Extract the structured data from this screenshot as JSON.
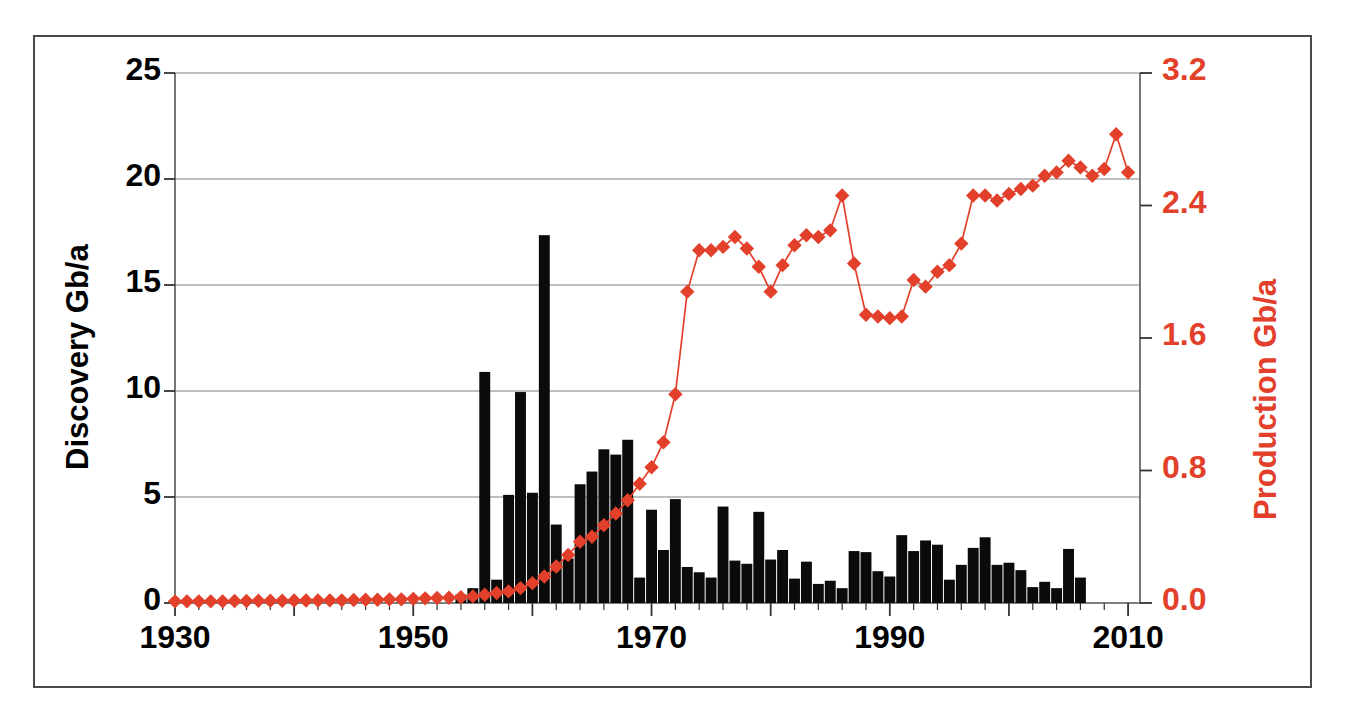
{
  "chart_data": {
    "type": "bar",
    "title": "",
    "subtitle": "",
    "xlabel": "",
    "ylabel": "Discovery Gb/a",
    "y2label": "Production Gb/a",
    "grid": true,
    "legend": "none",
    "xlim": [
      1930,
      2011
    ],
    "ylim": [
      0,
      25
    ],
    "y2lim": [
      0.0,
      3.2
    ],
    "x_ticks": [
      "1930",
      "1950",
      "1970",
      "1990",
      "2010"
    ],
    "x_tick_values": [
      1930,
      1950,
      1970,
      1990,
      2010
    ],
    "y_ticks": [
      "0",
      "5",
      "10",
      "15",
      "20",
      "25"
    ],
    "y_tick_values": [
      0,
      5,
      10,
      15,
      20,
      25
    ],
    "y2_ticks": [
      "0.0",
      "0.8",
      "1.6",
      "2.4",
      "3.2"
    ],
    "y2_tick_values": [
      0.0,
      0.8,
      1.6,
      2.4,
      3.2
    ],
    "colors": {
      "bars": "#0b0b0b",
      "line": "#E2402A",
      "marker": "#E2402A",
      "grid": "#808080",
      "axis": "#555555",
      "frame": "#4a4a4a",
      "left_axis_text": "#000000",
      "right_axis_text": "#E2402A"
    },
    "series": [
      {
        "name": "Discovery Gb/a",
        "type": "bar",
        "axis": "left",
        "x": [
          1930,
          1931,
          1932,
          1933,
          1934,
          1935,
          1936,
          1937,
          1938,
          1939,
          1940,
          1941,
          1942,
          1943,
          1944,
          1945,
          1946,
          1947,
          1948,
          1949,
          1950,
          1951,
          1952,
          1953,
          1954,
          1955,
          1956,
          1957,
          1958,
          1959,
          1960,
          1961,
          1962,
          1963,
          1964,
          1965,
          1966,
          1967,
          1968,
          1969,
          1970,
          1971,
          1972,
          1973,
          1974,
          1975,
          1976,
          1977,
          1978,
          1979,
          1980,
          1981,
          1982,
          1983,
          1984,
          1985,
          1986,
          1987,
          1988,
          1989,
          1990,
          1991,
          1992,
          1993,
          1994,
          1995,
          1996,
          1997,
          1998,
          1999,
          2000,
          2001,
          2002,
          2003,
          2004,
          2005,
          2006,
          2007,
          2008,
          2009,
          2010
        ],
        "values": [
          0,
          0,
          0,
          0,
          0,
          0,
          0,
          0,
          0,
          0,
          0,
          0,
          0,
          0,
          0,
          0,
          0,
          0,
          0,
          0,
          0,
          0,
          0,
          0,
          0.4,
          0.7,
          10.9,
          1.1,
          5.1,
          9.95,
          5.2,
          17.35,
          3.7,
          2.1,
          5.6,
          6.2,
          7.25,
          7.0,
          7.7,
          1.2,
          4.4,
          2.5,
          4.9,
          1.7,
          1.45,
          1.2,
          4.55,
          2.0,
          1.85,
          4.3,
          2.05,
          2.5,
          1.15,
          1.95,
          0.9,
          1.05,
          0.7,
          2.45,
          2.4,
          1.5,
          1.25,
          3.2,
          2.45,
          2.95,
          2.75,
          1.1,
          1.8,
          2.6,
          3.1,
          1.8,
          1.9,
          1.55,
          0.75,
          1.0,
          0.7,
          2.55,
          1.2,
          0,
          0,
          0,
          0
        ]
      },
      {
        "name": "Production Gb/a",
        "type": "line",
        "axis": "right",
        "marker": "diamond",
        "x": [
          1930,
          1931,
          1932,
          1933,
          1934,
          1935,
          1936,
          1937,
          1938,
          1939,
          1940,
          1941,
          1942,
          1943,
          1944,
          1945,
          1946,
          1947,
          1948,
          1949,
          1950,
          1951,
          1952,
          1953,
          1954,
          1955,
          1956,
          1957,
          1958,
          1959,
          1960,
          1961,
          1962,
          1963,
          1964,
          1965,
          1966,
          1967,
          1968,
          1969,
          1970,
          1971,
          1972,
          1973,
          1974,
          1975,
          1976,
          1977,
          1978,
          1979,
          1980,
          1981,
          1982,
          1983,
          1984,
          1985,
          1986,
          1987,
          1988,
          1989,
          1990,
          1991,
          1992,
          1993,
          1994,
          1995,
          1996,
          1997,
          1998,
          1999,
          2000,
          2001,
          2002,
          2003,
          2004,
          2005,
          2006,
          2007,
          2008,
          2009,
          2010
        ],
        "values": [
          0.01,
          0.01,
          0.01,
          0.01,
          0.01,
          0.012,
          0.012,
          0.014,
          0.014,
          0.014,
          0.015,
          0.015,
          0.015,
          0.016,
          0.016,
          0.018,
          0.02,
          0.02,
          0.022,
          0.022,
          0.025,
          0.028,
          0.03,
          0.032,
          0.035,
          0.04,
          0.05,
          0.06,
          0.07,
          0.09,
          0.12,
          0.16,
          0.22,
          0.29,
          0.37,
          0.4,
          0.47,
          0.54,
          0.62,
          0.72,
          0.82,
          0.97,
          1.26,
          1.88,
          2.13,
          2.13,
          2.15,
          2.21,
          2.14,
          2.03,
          1.88,
          2.04,
          2.16,
          2.22,
          2.21,
          2.25,
          2.46,
          2.05,
          1.74,
          1.73,
          1.72,
          1.73,
          1.95,
          1.91,
          2.0,
          2.04,
          2.17,
          2.46,
          2.46,
          2.43,
          2.47,
          2.5,
          2.52,
          2.58,
          2.6,
          2.67,
          2.63,
          2.58,
          2.62,
          2.83,
          2.6
        ]
      }
    ]
  },
  "axes": {
    "left_title": "Discovery Gb/a",
    "right_title": "Production Gb/a"
  }
}
